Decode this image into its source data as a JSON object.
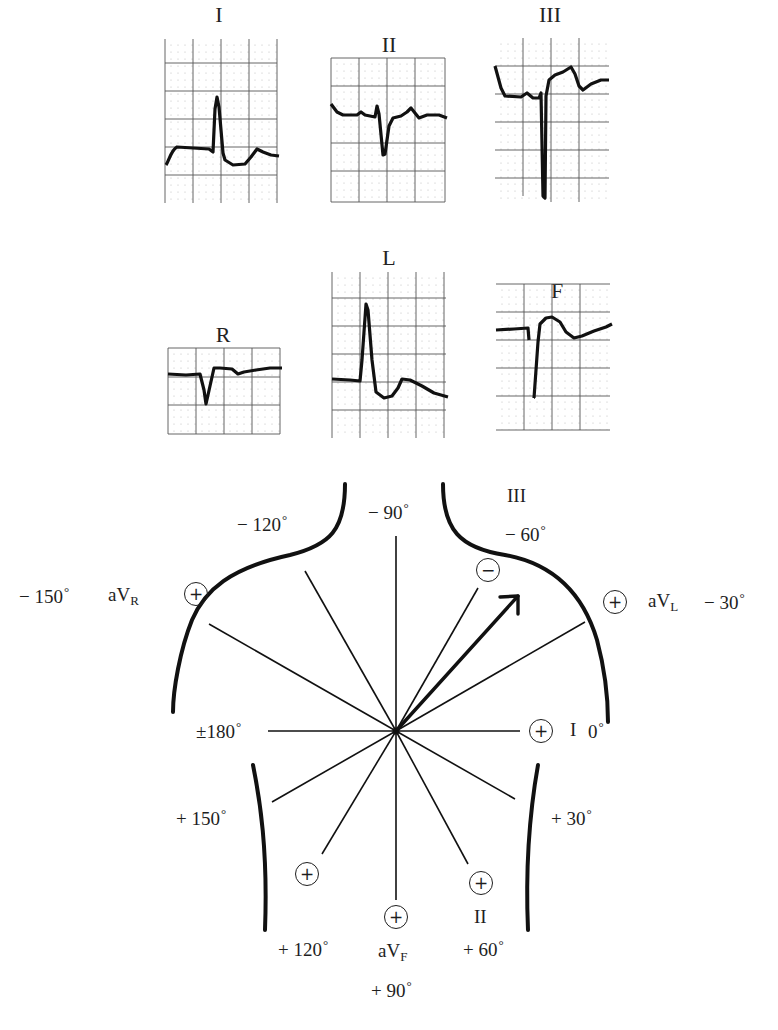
{
  "figure": {
    "limb_leads": [
      {
        "name": "I",
        "label": "I"
      },
      {
        "name": "II",
        "label": "II"
      },
      {
        "name": "III",
        "label": "III"
      }
    ],
    "augmented_leads": [
      {
        "name": "aVR",
        "label": "R"
      },
      {
        "name": "aVL",
        "label": "L"
      },
      {
        "name": "aVF",
        "label": "F"
      }
    ],
    "hexaxial": {
      "axis_labels": {
        "minus_90": "− 90",
        "minus_120": "− 120",
        "minus_60": "− 60",
        "minus_150": "− 150",
        "minus_30": "− 30",
        "plus_minus_180": "±180",
        "zero": "0",
        "plus_150": "+ 150",
        "plus_30": "+ 30",
        "plus_120": "+ 120",
        "plus_60": "+ 60",
        "plus_90": "+ 90"
      },
      "lead_labels": {
        "III": "III",
        "aVR_prefix": "aV",
        "aVR_sub": "R",
        "aVL_prefix": "aV",
        "aVL_sub": "L",
        "I": "I",
        "II": "II",
        "aVF_prefix": "aV",
        "aVF_sub": "F"
      },
      "pole_symbols": {
        "positive": "+",
        "negative": "−"
      },
      "mean_axis_degrees": -45,
      "line_color": "#1a1a1a"
    }
  }
}
